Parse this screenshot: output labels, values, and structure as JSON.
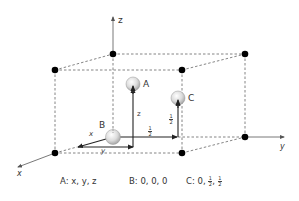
{
  "diagram": {
    "type": "unit-cell-coordinates",
    "axes": {
      "x": "x",
      "y": "y",
      "z": "z"
    },
    "points": [
      {
        "name": "A",
        "label": "A"
      },
      {
        "name": "B",
        "label": "B"
      },
      {
        "name": "C",
        "label": "C"
      }
    ],
    "vector_labels": {
      "x": "x",
      "y": "y",
      "z": "z",
      "half_horizontal": "1/2",
      "half_vertical": "1/2"
    },
    "fraction": {
      "num": "1",
      "den": "2"
    },
    "coordinates": [
      {
        "label": "A: x, y, z"
      },
      {
        "label": "B: 0, 0, 0"
      },
      {
        "prefix": "C: 0,",
        "sep": ","
      }
    ],
    "colors": {
      "line": "#333333",
      "dashed": "#777777",
      "vertex": "#000000",
      "sphere": "#d9d9d9"
    }
  }
}
